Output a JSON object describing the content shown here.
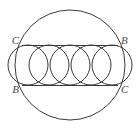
{
  "figure": {
    "background_color": "#ffffff",
    "stroke_color": "#3a3a3a",
    "label_color": "#4a4a4a",
    "canvas": {
      "width": 137,
      "height": 131
    }
  },
  "chart_data": {
    "type": "diagram",
    "title": "",
    "shapes": [
      {
        "name": "outer-circle",
        "kind": "circle",
        "cx": 70,
        "cy": 65,
        "r": 55,
        "stroke": "#3a3a3a",
        "stroke_width": 1,
        "fill": "none"
      },
      {
        "name": "top-chord",
        "kind": "line",
        "x1": 22,
        "y1": 45.5,
        "x2": 118,
        "y2": 45.5,
        "stroke": "#3a3a3a",
        "stroke_width": 1
      },
      {
        "name": "bottom-chord",
        "kind": "line",
        "x1": 22,
        "y1": 85.5,
        "x2": 118,
        "y2": 85.5,
        "stroke": "#3a3a3a",
        "stroke_width": 1
      }
    ],
    "inner_circles": {
      "count": 5,
      "r": 20,
      "cy": 65,
      "cx_values": [
        28,
        49,
        70,
        91,
        112
      ],
      "stroke": "#3a3a3a",
      "stroke_width": 1,
      "fill": "none"
    },
    "labels": [
      {
        "name": "label-top-left",
        "text": "C",
        "x": 19,
        "y": 41,
        "anchor": "end"
      },
      {
        "name": "label-top-right",
        "text": "B",
        "x": 121,
        "y": 41,
        "anchor": "start"
      },
      {
        "name": "label-bottom-left",
        "text": "B",
        "x": 19,
        "y": 90,
        "anchor": "end"
      },
      {
        "name": "label-bottom-right",
        "text": "C",
        "x": 121,
        "y": 90,
        "anchor": "start"
      }
    ],
    "xlabel": "",
    "ylabel": "",
    "grid": false,
    "legend": false
  },
  "labels": {
    "top_left": "C",
    "top_right": "B",
    "bottom_left": "B",
    "bottom_right": "C"
  }
}
